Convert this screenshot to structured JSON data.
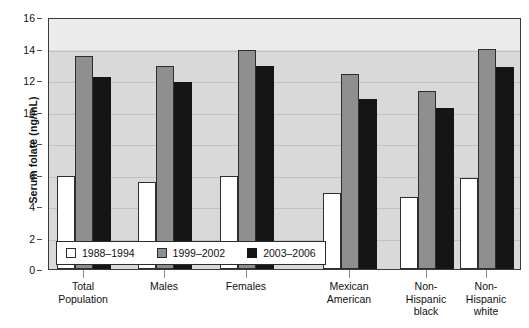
{
  "chart_data": {
    "type": "bar",
    "title": "",
    "xlabel": "",
    "ylabel": "Serum folate (ng/mL)",
    "ylim": [
      0,
      16
    ],
    "ytick_labels": [
      "0",
      "2",
      "4",
      "6",
      "8",
      "10",
      "12",
      "14",
      "16"
    ],
    "ytick_values": [
      0,
      2,
      4,
      6,
      8,
      10,
      12,
      14,
      16
    ],
    "grid": true,
    "legend_position": "bottom-left inside plot",
    "categories": [
      "Total\nPopulation",
      "Males",
      "Females",
      "Mexican\nAmerican",
      "Non-\nHispanic\nblack",
      "Non-\nHispanic\nwhite"
    ],
    "series": [
      {
        "name": "1988–1994",
        "color": "#ffffff",
        "values": [
          5.9,
          5.5,
          5.9,
          4.8,
          4.6,
          5.8
        ]
      },
      {
        "name": "1999–2002",
        "color": "#8f8f8f",
        "values": [
          13.5,
          12.9,
          13.9,
          12.4,
          11.3,
          14.0
        ]
      },
      {
        "name": "2003–2006",
        "color": "#151515",
        "values": [
          12.2,
          11.9,
          12.9,
          10.8,
          10.2,
          12.8
        ]
      }
    ]
  },
  "legend": {
    "entries": [
      {
        "label": "1988–1994",
        "swatch": "white"
      },
      {
        "label": "1999–2002",
        "swatch": "gray"
      },
      {
        "label": "2003–2006",
        "swatch": "black"
      }
    ]
  }
}
